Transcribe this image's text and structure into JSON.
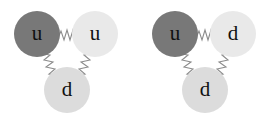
{
  "figure": {
    "background_color": "#ffffff",
    "width": 273,
    "height": 124
  },
  "colors": {
    "quark_dark": "#787878",
    "quark_light": "#e9e9e9",
    "quark_mid": "#dcdcdc",
    "gluon": "#8c8c8c",
    "label": "#101010"
  },
  "hadrons": [
    {
      "name": "proton",
      "offset_x": 0,
      "quarks": [
        {
          "id": "left",
          "label": "u",
          "flavor": "up",
          "shade": "dark",
          "cx": 37,
          "cy": 34,
          "r": 23
        },
        {
          "id": "right",
          "label": "u",
          "flavor": "up",
          "shade": "light",
          "cx": 95,
          "cy": 34,
          "r": 23
        },
        {
          "id": "bottom",
          "label": "d",
          "flavor": "down",
          "shade": "mid",
          "cx": 67,
          "cy": 90,
          "r": 23
        }
      ],
      "gluons": [
        {
          "id": "left-right",
          "from": "left",
          "to": "right"
        },
        {
          "id": "left-bottom",
          "from": "left",
          "to": "bottom"
        },
        {
          "id": "right-bottom",
          "from": "right",
          "to": "bottom"
        }
      ]
    },
    {
      "name": "neutron",
      "offset_x": 138,
      "quarks": [
        {
          "id": "left",
          "label": "u",
          "flavor": "up",
          "shade": "dark",
          "cx": 37,
          "cy": 34,
          "r": 23
        },
        {
          "id": "right",
          "label": "d",
          "flavor": "down",
          "shade": "light",
          "cx": 95,
          "cy": 34,
          "r": 23
        },
        {
          "id": "bottom",
          "label": "d",
          "flavor": "down",
          "shade": "mid",
          "cx": 67,
          "cy": 90,
          "r": 23
        }
      ],
      "gluons": [
        {
          "id": "left-right",
          "from": "left",
          "to": "right"
        },
        {
          "id": "left-bottom",
          "from": "left",
          "to": "bottom"
        },
        {
          "id": "right-bottom",
          "from": "right",
          "to": "bottom"
        }
      ]
    }
  ]
}
